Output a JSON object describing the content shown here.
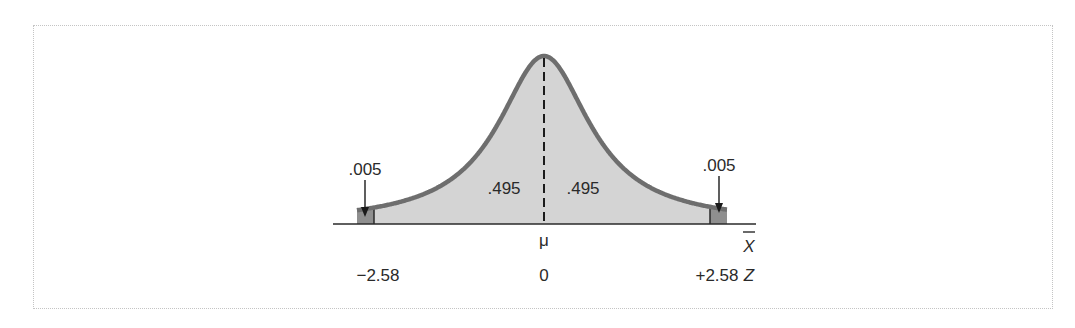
{
  "figure": {
    "type": "normal-distribution-two-tailed",
    "mean_label": "μ",
    "x_axis_symbol": "X",
    "x_axis_symbol_overbar": true,
    "z_axis_symbol": "Z",
    "z_values": {
      "left": "−2.58",
      "center": "0",
      "right": "+2.58"
    },
    "z_numeric": [
      -2.58,
      0,
      2.58
    ],
    "areas": {
      "left_tail": ".005",
      "left_center": ".495",
      "right_center": ".495",
      "right_tail": ".005"
    },
    "colors": {
      "curve_stroke": "#6e6e6e",
      "body_fill": "#d4d4d4",
      "tail_fill": "#8f8f8f",
      "axis": "#2a2a2a",
      "frame": "#c4c4c4"
    }
  }
}
